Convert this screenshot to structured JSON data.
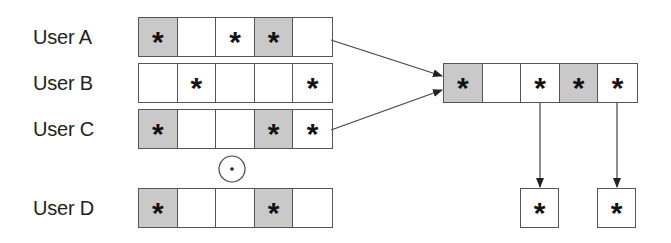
{
  "diagram": {
    "users": [
      {
        "label": "User A",
        "cells": [
          {
            "shaded": true,
            "star": "*"
          },
          {
            "shaded": false,
            "star": ""
          },
          {
            "shaded": false,
            "star": "*"
          },
          {
            "shaded": true,
            "star": "*"
          },
          {
            "shaded": false,
            "star": ""
          }
        ]
      },
      {
        "label": "User B",
        "cells": [
          {
            "shaded": false,
            "star": ""
          },
          {
            "shaded": false,
            "star": "*"
          },
          {
            "shaded": false,
            "star": ""
          },
          {
            "shaded": false,
            "star": ""
          },
          {
            "shaded": false,
            "star": "*"
          }
        ]
      },
      {
        "label": "User C",
        "cells": [
          {
            "shaded": true,
            "star": "*"
          },
          {
            "shaded": false,
            "star": ""
          },
          {
            "shaded": false,
            "star": ""
          },
          {
            "shaded": true,
            "star": "*"
          },
          {
            "shaded": false,
            "star": "*"
          }
        ]
      },
      {
        "label": "User D",
        "cells": [
          {
            "shaded": true,
            "star": "*"
          },
          {
            "shaded": false,
            "star": ""
          },
          {
            "shaded": false,
            "star": ""
          },
          {
            "shaded": true,
            "star": "*"
          },
          {
            "shaded": false,
            "star": ""
          }
        ]
      }
    ],
    "operator_symbol": "circled-dot",
    "result": {
      "cells": [
        {
          "shaded": true,
          "star": "*"
        },
        {
          "shaded": false,
          "star": ""
        },
        {
          "shaded": false,
          "star": "*"
        },
        {
          "shaded": true,
          "star": "*"
        },
        {
          "shaded": false,
          "star": "*"
        }
      ]
    },
    "outputs": [
      {
        "star": "*"
      },
      {
        "star": "*"
      }
    ],
    "colors": {
      "shaded": "#c9c9c9",
      "line": "#555555",
      "text": "#222222"
    }
  }
}
